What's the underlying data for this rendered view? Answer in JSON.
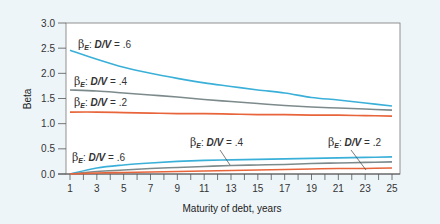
{
  "chart_data": {
    "type": "line",
    "title": "",
    "xlabel": "Maturity of debt, years",
    "ylabel": "Beta",
    "xlim": [
      1,
      25
    ],
    "ylim": [
      0,
      3.0
    ],
    "x_ticks": [
      1,
      3,
      5,
      7,
      9,
      11,
      13,
      15,
      17,
      19,
      21,
      23,
      25
    ],
    "x_minor_ticks": [
      1,
      2,
      3,
      4,
      5,
      6,
      7,
      8,
      9,
      10,
      11,
      12,
      13,
      14,
      15,
      16,
      17,
      18,
      19,
      20,
      21,
      22,
      23,
      24,
      25
    ],
    "y_ticks": [
      "0.0",
      "0.5",
      "1.0",
      "1.5",
      "2.0",
      "2.5",
      "3.0"
    ],
    "y_tick_values": [
      0,
      0.5,
      1.0,
      1.5,
      2.0,
      2.5,
      3.0
    ],
    "grid": false,
    "legend_position": "inline labels",
    "x": [
      1,
      3,
      5,
      7,
      9,
      11,
      13,
      15,
      17,
      19,
      21,
      23,
      25
    ],
    "series": [
      {
        "name": "βE: D/V = .6 (upper)",
        "label_beta": "β",
        "label_sub": "E",
        "label_text": "D/V",
        "label_value": " = .6",
        "color": "#3ab0d9",
        "values": [
          2.46,
          2.28,
          2.12,
          2.0,
          1.9,
          1.81,
          1.74,
          1.67,
          1.61,
          1.52,
          1.47,
          1.41,
          1.35
        ]
      },
      {
        "name": "βE: D/V = .4 (upper)",
        "label_beta": "β",
        "label_sub": "E",
        "label_text": "D/V",
        "label_value": " = .4",
        "color": "#7d8a8c",
        "values": [
          1.67,
          1.65,
          1.61,
          1.57,
          1.53,
          1.48,
          1.44,
          1.4,
          1.36,
          1.33,
          1.31,
          1.29,
          1.27
        ]
      },
      {
        "name": "βE: D/V = .2 (upper)",
        "label_beta": "β",
        "label_sub": "E",
        "label_text": "D/V",
        "label_value": " = .2",
        "color": "#e8643a",
        "values": [
          1.23,
          1.23,
          1.22,
          1.21,
          1.2,
          1.2,
          1.19,
          1.18,
          1.18,
          1.17,
          1.17,
          1.16,
          1.15
        ]
      },
      {
        "name": "βE: D/V = .6 (lower)",
        "label_beta": "β",
        "label_sub": "E",
        "label_text": "D/V",
        "label_value": " = .6",
        "color": "#3ab0d9",
        "values": [
          0.0,
          0.12,
          0.18,
          0.22,
          0.25,
          0.27,
          0.28,
          0.29,
          0.3,
          0.31,
          0.32,
          0.33,
          0.34
        ]
      },
      {
        "name": "βE: D/V = .4 (lower)",
        "label_beta": "β",
        "label_sub": "E",
        "label_text": "D/V",
        "label_value": " = .4",
        "color": "#7d8a8c",
        "values": [
          0.0,
          0.05,
          0.08,
          0.11,
          0.13,
          0.15,
          0.17,
          0.18,
          0.19,
          0.21,
          0.22,
          0.23,
          0.24
        ]
      },
      {
        "name": "βE: D/V = .2 (lower)",
        "label_beta": "β",
        "label_sub": "E",
        "label_text": "D/V",
        "label_value": " = .2",
        "color": "#e8643a",
        "values": [
          0.0,
          0.02,
          0.03,
          0.04,
          0.05,
          0.06,
          0.07,
          0.08,
          0.09,
          0.1,
          0.11,
          0.11,
          0.12
        ]
      }
    ],
    "annotations": [
      {
        "series": 0,
        "label_x": 78,
        "label_y": 48,
        "leader": null
      },
      {
        "series": 1,
        "label_x": 74,
        "label_y": 85,
        "leader": null
      },
      {
        "series": 2,
        "label_x": 74,
        "label_y": 106,
        "leader": null
      },
      {
        "series": 3,
        "label_x": 72,
        "label_y": 161,
        "leader": null
      },
      {
        "series": 4,
        "label_x": 190,
        "label_y": 146,
        "leader": [
          [
            220,
            150
          ],
          [
            230,
            165
          ]
        ]
      },
      {
        "series": 5,
        "label_x": 328,
        "label_y": 146,
        "leader": [
          [
            351,
            150
          ],
          [
            366,
            170
          ]
        ]
      }
    ]
  },
  "colors": {
    "background": "#eef5f9",
    "plot_background": "#ffffff",
    "axis": "#555555"
  }
}
